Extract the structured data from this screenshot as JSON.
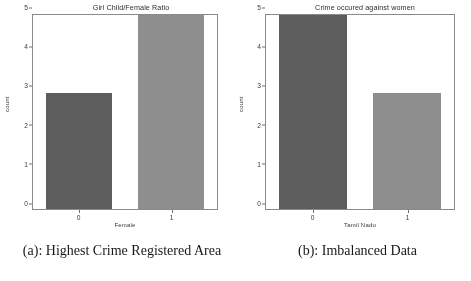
{
  "figure": {
    "panels": [
      {
        "id": "panel-a",
        "caption": "(a): Highest Crime Registered Area",
        "chart_data": {
          "type": "bar",
          "title": "Girl Child/Female Ratio",
          "xlabel": "Female",
          "ylabel": "count",
          "categories": [
            "0",
            "1"
          ],
          "values": [
            3,
            5
          ],
          "ylim": [
            0,
            5
          ],
          "yticks": [
            "0",
            "1",
            "2",
            "3",
            "4",
            "5"
          ],
          "grid": false,
          "legend": "none",
          "bar_colors": [
            "#5e5e5e",
            "#8e8e8e"
          ]
        }
      },
      {
        "id": "panel-b",
        "caption": "(b): Imbalanced Data",
        "chart_data": {
          "type": "bar",
          "title": "Crime occured against women",
          "xlabel": "Tamil Nadu",
          "ylabel": "count",
          "categories": [
            "0",
            "1"
          ],
          "values": [
            5,
            3
          ],
          "ylim": [
            0,
            5
          ],
          "yticks": [
            "0",
            "1",
            "2",
            "3",
            "4",
            "5"
          ],
          "grid": false,
          "legend": "none",
          "bar_colors": [
            "#5e5e5e",
            "#8e8e8e"
          ]
        }
      }
    ]
  },
  "chart_data": [
    {
      "type": "bar",
      "title": "Girl Child/Female Ratio",
      "xlabel": "Female",
      "ylabel": "count",
      "categories": [
        "0",
        "1"
      ],
      "values": [
        3,
        5
      ],
      "ylim": [
        0,
        5
      ],
      "yticks": [
        "0",
        "1",
        "2",
        "3",
        "4",
        "5"
      ],
      "grid": false,
      "legend": "none"
    },
    {
      "type": "bar",
      "title": "Crime occured against women",
      "xlabel": "Tamil Nadu",
      "ylabel": "count",
      "categories": [
        "0",
        "1"
      ],
      "values": [
        5,
        3
      ],
      "ylim": [
        0,
        5
      ],
      "yticks": [
        "0",
        "1",
        "2",
        "3",
        "4",
        "5"
      ],
      "grid": false,
      "legend": "none"
    }
  ]
}
